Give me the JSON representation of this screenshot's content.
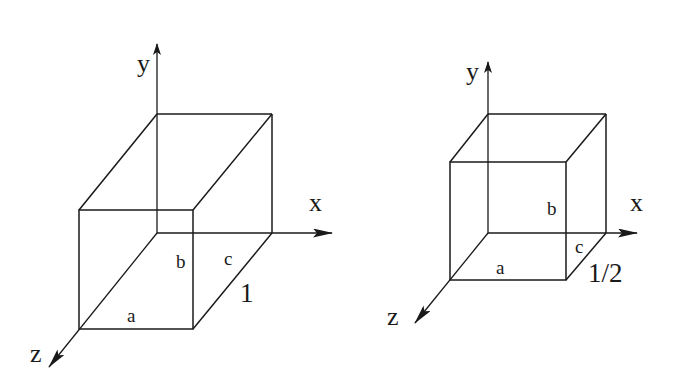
{
  "figure": {
    "left_box": {
      "axes": {
        "x": "x",
        "y": "y",
        "z": "z"
      },
      "edge_labels": {
        "a": "a",
        "b": "b",
        "c": "c"
      },
      "depth_label": "1"
    },
    "right_box": {
      "axes": {
        "x": "x",
        "y": "y",
        "z": "z"
      },
      "edge_labels": {
        "a": "a",
        "b": "b",
        "c": "c"
      },
      "depth_label": "1/2"
    },
    "colors": {
      "line": "#1a1a1a",
      "background": "#ffffff"
    }
  }
}
